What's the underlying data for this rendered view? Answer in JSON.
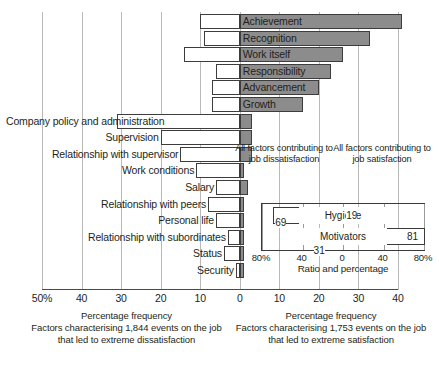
{
  "chart_data": {
    "type": "bar",
    "title": "",
    "orientation": "horizontal-diverging",
    "categories": [
      "Achievement",
      "Recognition",
      "Work itself",
      "Responsibility",
      "Advancement",
      "Growth",
      "Company policy and administration",
      "Supervision",
      "Relationship with supervisor",
      "Work conditions",
      "Salary",
      "Relationship with peers",
      "Personal life",
      "Relationship with subordinates",
      "Status",
      "Security"
    ],
    "series": [
      {
        "name": "Factors characterising 1,844 events on the job that led to extreme dissatisfaction",
        "side": "left",
        "color": "#ffffff",
        "values": [
          10,
          9,
          14,
          6,
          7,
          7,
          31,
          20,
          15,
          11,
          6,
          8,
          6,
          3,
          4,
          1
        ]
      },
      {
        "name": "Factors characterising 1,753 events on the job that led to extreme satisfaction",
        "side": "right",
        "color": "#8c8c8c",
        "values": [
          41,
          33,
          26,
          23,
          20,
          16,
          3,
          3,
          3,
          1,
          2,
          1,
          1,
          1,
          1,
          1
        ]
      }
    ],
    "xlabel_left": "Percentage frequency",
    "xlabel_right": "Percentage frequency",
    "xlim_left": [
      0,
      50
    ],
    "xlim_right": [
      0,
      40
    ],
    "grid": true,
    "legend_position": "none",
    "left_ticks": [
      "50%",
      "40",
      "30",
      "20",
      "10",
      "0"
    ],
    "right_ticks": [
      "10",
      "20",
      "30",
      "40"
    ],
    "inset": {
      "type": "bar",
      "orientation": "horizontal-diverging",
      "heading_left": "All factors contributing to job dissatisfaction",
      "heading_right": "All factors contributing to job satisfaction",
      "categories": [
        "Hygiene",
        "Motivators"
      ],
      "values_left": [
        69,
        31
      ],
      "values_right": [
        19,
        81
      ],
      "labels_left": [
        "69",
        "31"
      ],
      "labels_right": [
        "19",
        "81"
      ],
      "axis_label": "Ratio and percentage",
      "ticks": [
        "80%",
        "40",
        "0",
        "40",
        "80%"
      ],
      "xlim": [
        80,
        80
      ]
    }
  },
  "axis": {
    "ticks": [
      {
        "label": "50%",
        "pos": 0
      },
      {
        "label": "40",
        "pos": 10
      },
      {
        "label": "30",
        "pos": 20
      },
      {
        "label": "20",
        "pos": 30
      },
      {
        "label": "10",
        "pos": 40
      },
      {
        "label": "0",
        "pos": 50
      },
      {
        "label": "10",
        "pos": 60
      },
      {
        "label": "20",
        "pos": 70
      },
      {
        "label": "30",
        "pos": 80
      },
      {
        "label": "40",
        "pos": 90
      }
    ]
  },
  "captions": {
    "left_title": "Percentage frequency",
    "left_body": "Factors characterising 1,844 events on the job that led to extreme dissatisfaction",
    "right_title": "Percentage frequency",
    "right_body": "Factors characterising 1,753 events on the job that led to extreme satisfaction"
  },
  "inset_ui": {
    "heading_left": "All factors contributing to job dissatisfaction",
    "heading_right": "All factors contributing to job satisfaction",
    "hygiene_label": "Hygiene",
    "motivators_label": "Motivators",
    "hygiene_left_value": "69",
    "hygiene_right_value": "19",
    "motivators_left_value": "31",
    "motivators_right_value": "81",
    "axis_label": "Ratio and percentage",
    "tick_0": "80%",
    "tick_1": "40",
    "tick_2": "0",
    "tick_3": "40",
    "tick_4": "80%"
  },
  "colors": {
    "dissatisfaction_bar": "#ffffff",
    "satisfaction_bar": "#8c8c8c",
    "gridline": "#b9b9b9",
    "outline": "#3d3d3d",
    "text": "#231f20"
  }
}
